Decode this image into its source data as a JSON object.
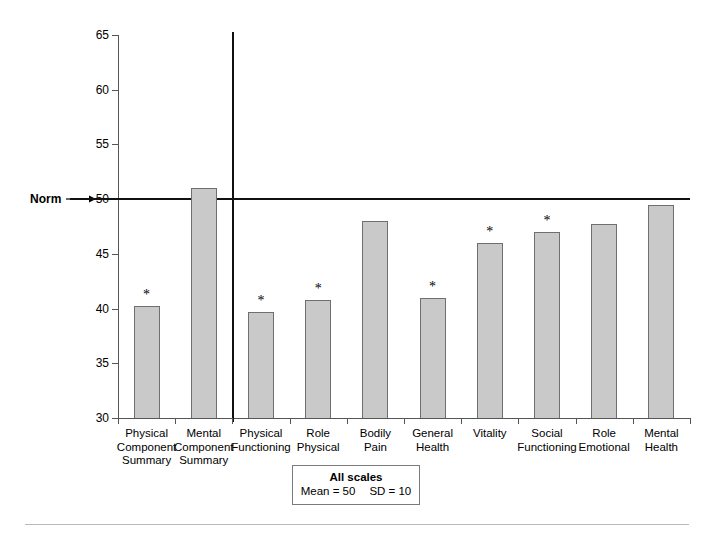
{
  "chart_data": {
    "type": "bar",
    "title": "",
    "subtitle": "",
    "xlabel": "",
    "ylabel": "",
    "ylim": [
      30,
      65
    ],
    "ytick_values": [
      30,
      35,
      40,
      45,
      50,
      55,
      60,
      65
    ],
    "ytick_labels": [
      "30",
      "35",
      "40",
      "45",
      "50",
      "55",
      "60",
      "65"
    ],
    "grid": false,
    "legend_position": "bottom-center",
    "categories": [
      "Physical\nComponent\nSummary",
      "Mental\nComponent\nSummary",
      "Physical\nFunctioning",
      "Role\nPhysical",
      "Bodily\nPain",
      "General\nHealth",
      "Vitality",
      "Social\nFunctioning",
      "Role\nEmotional",
      "Mental\nHealth"
    ],
    "values": [
      40.2,
      51.0,
      39.7,
      40.8,
      48.0,
      41.0,
      46.0,
      47.0,
      47.7,
      49.5
    ],
    "significance_markers": [
      "*",
      "",
      "*",
      "*",
      "",
      "*",
      "*",
      "*",
      "",
      ""
    ],
    "reference_line": {
      "label": "Norm",
      "value": 50
    },
    "section_divider_after_category_index": 1,
    "bar_color": "#c9c9c9",
    "bar_edge_color": "#6f6f6f",
    "reference_line_color": "#111111",
    "axis_color": "#555555"
  },
  "annotations": {
    "norm_label": "Norm"
  },
  "legend": {
    "title": "All scales",
    "mean": "Mean = 50",
    "sd": "SD = 10"
  }
}
